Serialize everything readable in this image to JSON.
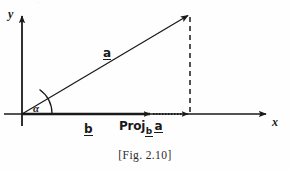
{
  "figure": {
    "caption": "[Fig. 2.10]",
    "background_color": "#fefefe",
    "ink_color": "#1a1a1a",
    "top_edge_artifact": "··"
  },
  "axes": {
    "x_label": "x",
    "y_label": "y",
    "origin": {
      "x": 22,
      "y": 114
    },
    "x_axis_end": {
      "x": 268,
      "y": 114
    },
    "y_axis_end": {
      "x": 22,
      "y": 14
    }
  },
  "angle": {
    "symbol": "α",
    "name": "alpha",
    "vertex": {
      "x": 22,
      "y": 114
    }
  },
  "vectors": [
    {
      "name": "vector-a",
      "label": "a",
      "underlined": true,
      "from": {
        "x": 22,
        "y": 114
      },
      "to": {
        "x": 190,
        "y": 14
      },
      "style": "solid"
    },
    {
      "name": "vector-b",
      "label": "b",
      "underlined": true,
      "from": {
        "x": 22,
        "y": 114
      },
      "to": {
        "x": 152,
        "y": 114
      },
      "style": "solid"
    },
    {
      "name": "projection-of-a-onto-b",
      "label_prefix": "Proj",
      "label_subscript": "b",
      "label_argument": "a",
      "from": {
        "x": 152,
        "y": 114
      },
      "to": {
        "x": 190,
        "y": 114
      },
      "style": "dotted"
    }
  ],
  "guide_lines": [
    {
      "name": "perpendicular-drop-line",
      "from": {
        "x": 190,
        "y": 14
      },
      "to": {
        "x": 190,
        "y": 114
      },
      "style": "dashed"
    }
  ]
}
